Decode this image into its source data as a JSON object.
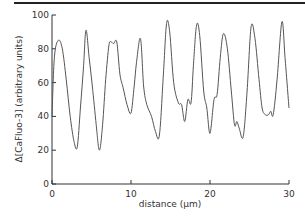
{
  "chart_data": {
    "type": "line",
    "title": "",
    "xlabel": "distance (µm)",
    "ylabel": "Δ[CaFluo-3] (arbitrary units)",
    "xlim": [
      0,
      30
    ],
    "ylim": [
      0,
      100
    ],
    "xticks": [
      0,
      10,
      20,
      30
    ],
    "yticks": [
      0,
      20,
      40,
      60,
      80,
      100
    ],
    "grid": false,
    "legend": null,
    "series": [
      {
        "name": "CaFluo-3 profile",
        "color": "#555555",
        "x": [
          0,
          0.3,
          0.8,
          1.3,
          1.8,
          2.3,
          2.8,
          3.2,
          3.6,
          4.0,
          4.3,
          4.7,
          5.1,
          5.6,
          6.0,
          6.4,
          6.8,
          7.2,
          7.5,
          7.8,
          8.2,
          8.6,
          9.0,
          9.5,
          10.0,
          10.4,
          10.7,
          11.2,
          11.6,
          12.0,
          12.6,
          13.1,
          13.6,
          14.1,
          14.5,
          14.9,
          15.4,
          16.0,
          16.4,
          16.8,
          17.2,
          17.6,
          17.9,
          18.3,
          18.7,
          19.2,
          19.6,
          20.0,
          20.5,
          20.9,
          21.3,
          21.7,
          22.2,
          22.7,
          23.1,
          23.4,
          23.7,
          24.2,
          24.7,
          25.2,
          25.7,
          26.2,
          26.6,
          27.0,
          27.4,
          27.7,
          28.0,
          28.5,
          29.1,
          29.5,
          30.0
        ],
        "values": [
          40,
          75,
          85,
          80,
          62,
          40,
          25,
          22,
          45,
          70,
          91,
          75,
          58,
          35,
          20,
          35,
          62,
          82,
          84,
          83,
          84,
          65,
          57,
          47,
          42,
          58,
          72,
          86,
          58,
          47,
          40,
          31,
          29,
          65,
          95,
          90,
          60,
          48,
          47,
          37,
          50,
          48,
          70,
          94,
          88,
          55,
          45,
          30,
          50,
          53,
          75,
          89,
          80,
          55,
          35,
          37,
          33,
          28,
          55,
          93,
          86,
          62,
          45,
          41,
          41,
          43,
          41,
          62,
          96,
          75,
          45
        ]
      }
    ]
  }
}
